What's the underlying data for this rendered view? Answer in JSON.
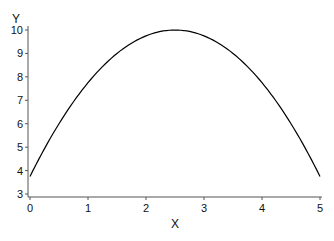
{
  "chart_data": {
    "type": "line",
    "title": "",
    "xlabel": "X",
    "ylabel": "Y",
    "xlim": [
      0,
      5
    ],
    "ylim": [
      3,
      10
    ],
    "xticks": [
      0,
      1,
      2,
      3,
      4,
      5
    ],
    "yticks": [
      3,
      4,
      5,
      6,
      7,
      8,
      9,
      10
    ],
    "grid": false,
    "legend": null,
    "series": [
      {
        "name": "y = 10 - (x - 2.5)^2",
        "color": "#000000",
        "x": [
          0,
          0.25,
          0.5,
          0.75,
          1,
          1.25,
          1.5,
          1.75,
          2,
          2.25,
          2.5,
          2.75,
          3,
          3.25,
          3.5,
          3.75,
          4,
          4.25,
          4.5,
          4.75,
          5
        ],
        "y": [
          3.75,
          4.94,
          6.0,
          6.94,
          7.75,
          8.44,
          9.0,
          9.44,
          9.75,
          9.94,
          10.0,
          9.94,
          9.75,
          9.44,
          9.0,
          8.44,
          7.75,
          6.94,
          6.0,
          4.94,
          3.75
        ]
      }
    ]
  },
  "axes": {
    "x_label": "X",
    "y_label": "Y"
  }
}
